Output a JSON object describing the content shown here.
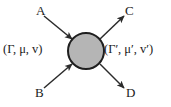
{
  "figure": {
    "kind": "scattering-vertex-diagram",
    "background_color": "#ffffff",
    "line_color": "#2b2b2b",
    "text_color": "#1a1a1a"
  },
  "vertex": {
    "name": "interaction-blob",
    "shape": "circle",
    "center_x": 86,
    "center_y": 51,
    "radius": 18,
    "fill_color": "#b5b5b5",
    "stroke_color": "#1f1f1f",
    "stroke_width": 2
  },
  "legs": [
    {
      "id": "A",
      "label": "A",
      "direction": "incoming",
      "position": "top-left",
      "x1": 44,
      "y1": 16,
      "x2": 72,
      "y2": 39
    },
    {
      "id": "B",
      "label": "B",
      "direction": "incoming",
      "position": "bottom-left",
      "x1": 44,
      "y1": 88,
      "x2": 72,
      "y2": 64
    },
    {
      "id": "C",
      "label": "C",
      "direction": "outgoing",
      "position": "top-right",
      "x1": 100,
      "y1": 39,
      "x2": 124,
      "y2": 16
    },
    {
      "id": "D",
      "label": "D",
      "direction": "outgoing",
      "position": "bottom-right",
      "x1": 100,
      "y1": 64,
      "x2": 124,
      "y2": 88
    }
  ],
  "channels": {
    "incoming": {
      "text": "(Γ, μ, v)",
      "open_paren": "(",
      "gamma": "Γ",
      "comma_1": ",",
      "mu": "μ",
      "comma_2": ",",
      "v": "v",
      "close_paren": ")",
      "side": "left"
    },
    "outgoing": {
      "text": "(Γ′, μ′, v′)",
      "open_paren": "(",
      "gamma": "Γ′",
      "comma_1": ",",
      "mu": "μ′",
      "comma_2": ",",
      "v": "v′",
      "close_paren": ")",
      "side": "right"
    }
  }
}
